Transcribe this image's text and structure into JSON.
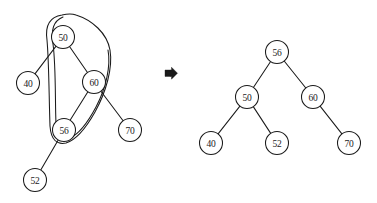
{
  "figure": {
    "colors": {
      "ink": "#1a1a1a",
      "paper": "#ffffff"
    }
  },
  "transform_arrow": {
    "icon": "arrow-right-hollow-icon",
    "glyph": "⇨",
    "x": 171,
    "y": 73
  },
  "left_tree": {
    "caption": "before",
    "node_radius": 11.5,
    "nodes": [
      {
        "id": "L50",
        "label": "50",
        "cx": 63,
        "cy": 37
      },
      {
        "id": "L40",
        "label": "40",
        "cx": 28,
        "cy": 83
      },
      {
        "id": "L60",
        "label": "60",
        "cx": 94,
        "cy": 82
      },
      {
        "id": "L56",
        "label": "56",
        "cx": 64,
        "cy": 130
      },
      {
        "id": "L70",
        "label": "70",
        "cx": 130,
        "cy": 130
      },
      {
        "id": "L52",
        "label": "52",
        "cx": 35,
        "cy": 180
      }
    ],
    "edges": [
      {
        "from": "L50",
        "to": "L40"
      },
      {
        "from": "L50",
        "to": "L60"
      },
      {
        "from": "L60",
        "to": "L56"
      },
      {
        "from": "L60",
        "to": "L70"
      },
      {
        "from": "L56",
        "to": "L52"
      }
    ],
    "selection_loop": {
      "name": "selection-lasso",
      "encircled_nodes": [
        "50",
        "60",
        "56"
      ]
    }
  },
  "right_tree": {
    "caption": "after",
    "node_radius": 11.5,
    "nodes": [
      {
        "id": "R56",
        "label": "56",
        "cx": 277,
        "cy": 52
      },
      {
        "id": "R50",
        "label": "50",
        "cx": 247,
        "cy": 97
      },
      {
        "id": "R60",
        "label": "60",
        "cx": 313,
        "cy": 97
      },
      {
        "id": "R40",
        "label": "40",
        "cx": 211,
        "cy": 143
      },
      {
        "id": "R52",
        "label": "52",
        "cx": 277,
        "cy": 143
      },
      {
        "id": "R70",
        "label": "70",
        "cx": 349,
        "cy": 143
      }
    ],
    "edges": [
      {
        "from": "R56",
        "to": "R50"
      },
      {
        "from": "R56",
        "to": "R60"
      },
      {
        "from": "R50",
        "to": "R40"
      },
      {
        "from": "R50",
        "to": "R52"
      },
      {
        "from": "R60",
        "to": "R70"
      }
    ]
  }
}
